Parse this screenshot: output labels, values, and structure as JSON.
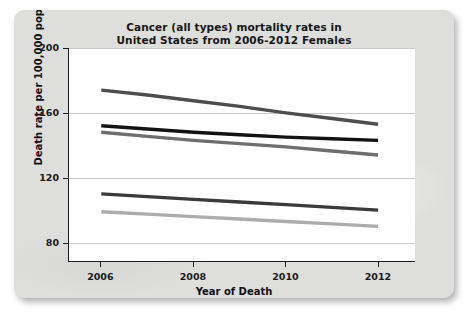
{
  "chart_data": {
    "type": "line",
    "title": "Cancer (all types) mortality rates in\nUnited States from 2006-2012 Females",
    "title_line1": "Cancer (all types) mortality rates in",
    "title_line2": "United States from 2006-2012 Females",
    "xlabel": "Year of Death",
    "ylabel": "Death rate per 100,000 population",
    "x": [
      2006,
      2007,
      2008,
      2009,
      2010,
      2011,
      2012
    ],
    "xticks": [
      2006,
      2008,
      2010,
      2012
    ],
    "xtick_labels": [
      "2006",
      "2008",
      "2010",
      "2012"
    ],
    "yticks": [
      80,
      120,
      160,
      200
    ],
    "ytick_labels": [
      "80",
      "120",
      "160",
      "200"
    ],
    "xlim": [
      2005.3,
      2012.8
    ],
    "ylim": [
      68,
      200
    ],
    "grid": "horizontal",
    "legend": "none",
    "series": [
      {
        "name": "series-1",
        "color": "#4d4d4d",
        "values": [
          174,
          171,
          167.5,
          164,
          160,
          156.5,
          153
        ]
      },
      {
        "name": "series-2",
        "color": "#121212",
        "values": [
          152,
          150,
          148,
          146.5,
          145,
          144,
          143
        ]
      },
      {
        "name": "series-3",
        "color": "#6e6e6e",
        "values": [
          148,
          145.5,
          143,
          141,
          139,
          136.5,
          134
        ]
      },
      {
        "name": "series-4",
        "color": "#3a3a3a",
        "values": [
          110,
          108.3,
          106.6,
          105,
          103.4,
          101.7,
          100
        ]
      },
      {
        "name": "series-5",
        "color": "#acacac",
        "values": [
          99,
          97.5,
          96,
          94.5,
          93,
          91.5,
          90
        ]
      }
    ]
  },
  "figure": {
    "card_background": "#dededc",
    "plot_background": "#ffffff",
    "axis_color": "#1c1c1c",
    "grid_color": "#c9c9c9"
  }
}
